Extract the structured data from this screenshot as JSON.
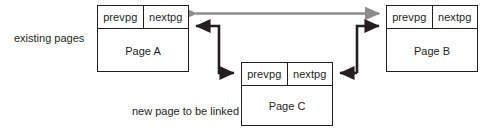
{
  "diagram": {
    "captions": {
      "existing": "existing pages",
      "new_page": "new page to be linked"
    },
    "colors": {
      "stroke": "#231f20",
      "old_link": "#8c8c8c",
      "background": "#ffffff"
    },
    "pages": [
      {
        "id": "page-a",
        "name": "Page A",
        "prev_label": "prevpg",
        "next_label": "nextpg"
      },
      {
        "id": "page-b",
        "name": "Page B",
        "prev_label": "prevpg",
        "next_label": "nextpg"
      },
      {
        "id": "page-c",
        "name": "Page C",
        "prev_label": "prevpg",
        "next_label": "nextpg"
      }
    ],
    "arrows": [
      {
        "id": "old-link-a-b",
        "style": "double-headed",
        "color": "old_link",
        "from": "Page A nextpg",
        "to": "Page B prevpg"
      },
      {
        "id": "link-c-prev-to-a",
        "style": "single-headed",
        "color": "stroke",
        "from": "Page C prevpg",
        "to": "Page A nextpg"
      },
      {
        "id": "link-a-next-to-c",
        "style": "single-headed",
        "color": "stroke",
        "from": "Page A nextpg",
        "to": "Page C prevpg"
      },
      {
        "id": "link-c-next-to-b",
        "style": "single-headed",
        "color": "stroke",
        "from": "Page C nextpg",
        "to": "Page B prevpg"
      },
      {
        "id": "link-b-prev-to-c",
        "style": "single-headed",
        "color": "stroke",
        "from": "Page B prevpg",
        "to": "Page C nextpg"
      }
    ]
  }
}
